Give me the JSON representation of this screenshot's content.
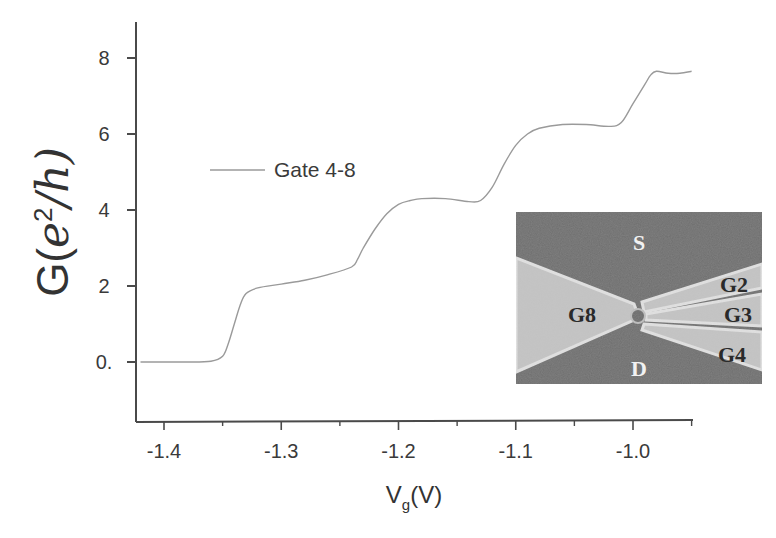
{
  "chart_data": {
    "type": "line",
    "title": "",
    "xlabel": "V_g(V)",
    "xlabel_main": "V",
    "xlabel_sub": "g",
    "xlabel_unit": "(V)",
    "ylabel": "G(e^2/h)",
    "ylabel_prefix": "G(",
    "ylabel_e": "e",
    "ylabel_sup": "2",
    "ylabel_suffix": "/h)",
    "xlim": [
      -1.42,
      -0.95
    ],
    "ylim": [
      -1.6,
      9.5
    ],
    "x_ticks": [
      -1.4,
      -1.3,
      -1.2,
      -1.1,
      -1.0
    ],
    "x_tick_labels": [
      "-1.4",
      "-1.3",
      "-1.2",
      "-1.1",
      "-1.0"
    ],
    "y_ticks": [
      0,
      2,
      4,
      6,
      8
    ],
    "y_tick_labels": [
      "0.",
      "2",
      "4",
      "6",
      "8"
    ],
    "grid": false,
    "legend": {
      "position": "upper-left",
      "entries": [
        "Gate 4-8"
      ]
    },
    "series": [
      {
        "name": "Gate 4-8",
        "color": "#9a9a9a",
        "x": [
          -1.42,
          -1.4,
          -1.38,
          -1.36,
          -1.35,
          -1.345,
          -1.34,
          -1.335,
          -1.33,
          -1.32,
          -1.3,
          -1.28,
          -1.26,
          -1.24,
          -1.235,
          -1.23,
          -1.22,
          -1.21,
          -1.2,
          -1.19,
          -1.18,
          -1.16,
          -1.14,
          -1.13,
          -1.12,
          -1.11,
          -1.1,
          -1.09,
          -1.08,
          -1.06,
          -1.04,
          -1.02,
          -1.01,
          -1.0,
          -0.99,
          -0.985,
          -0.98,
          -0.97,
          -0.96,
          -0.95
        ],
        "values": [
          0.0,
          0.0,
          0.0,
          0.02,
          0.15,
          0.5,
          1.0,
          1.5,
          1.8,
          1.95,
          2.05,
          2.15,
          2.3,
          2.5,
          2.7,
          3.0,
          3.5,
          3.9,
          4.15,
          4.25,
          4.3,
          4.3,
          4.22,
          4.25,
          4.6,
          5.2,
          5.7,
          6.0,
          6.15,
          6.25,
          6.25,
          6.2,
          6.3,
          6.8,
          7.3,
          7.55,
          7.65,
          7.6,
          7.6,
          7.65
        ]
      }
    ],
    "inset": {
      "description": "Device micrograph",
      "labels": [
        "S",
        "D",
        "G8",
        "G2",
        "G3",
        "G4"
      ]
    }
  },
  "colors": {
    "axis": "#4a4a4a",
    "curve": "#9a9a9a",
    "inset_dark": "#6e6e6e",
    "inset_light": "#c4c4c4",
    "inset_highlight": "#e2e2e2"
  }
}
